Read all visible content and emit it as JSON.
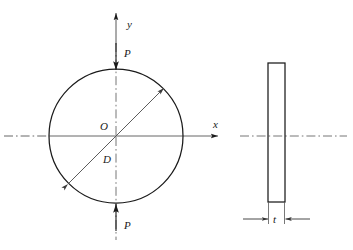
{
  "figure": {
    "labels": {
      "axis_y": "y",
      "axis_x": "x",
      "center": "O",
      "diameter": "D",
      "load_top": "P",
      "load_bottom": "P",
      "thickness": "t"
    },
    "colors": {
      "outline": "#1a1a1a",
      "centerline": "#555555",
      "dimension": "#555555",
      "background": "#ffffff"
    },
    "front_view": {
      "shape": "circle",
      "center_x": 116,
      "center_y": 136,
      "radius": 67,
      "diameter_line": {
        "from_x": 68,
        "from_y": 184,
        "to_x": 164,
        "to_y": 88,
        "arrows": "both"
      },
      "axis_y": {
        "x": 116,
        "top_y": 12,
        "bottom_y": 240,
        "arrow": "up"
      },
      "axis_x": {
        "y": 136,
        "left_x": 4,
        "right_x": 220,
        "arrow": "right"
      },
      "load_arrows": [
        {
          "name": "top",
          "x": 116,
          "from_y": 42,
          "to_y": 69,
          "direction": "down"
        },
        {
          "name": "bottom",
          "x": 116,
          "from_y": 230,
          "to_y": 203,
          "direction": "up"
        }
      ]
    },
    "side_view": {
      "shape": "rectangle",
      "left_x": 268,
      "right_x": 285,
      "top_y": 63,
      "bottom_y": 202,
      "centerline": {
        "y": 136,
        "left_x": 240,
        "right_x": 347
      },
      "dimension": {
        "y": 219,
        "extension_left_x": 268,
        "extension_right_x": 285,
        "leader_left_x": 243,
        "leader_right_x": 310,
        "label": "t"
      }
    }
  }
}
